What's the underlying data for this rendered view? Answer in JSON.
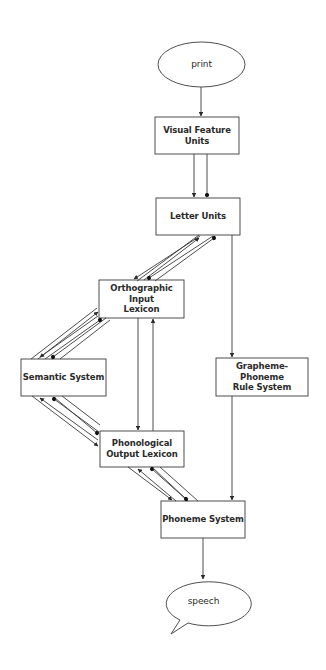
{
  "diagram": {
    "type": "dual-route reading model flow diagram",
    "colors": {
      "stroke": "#3a3a3a",
      "fill": "#ffffff",
      "text": "#2a2a2a",
      "background": "#ffffff"
    },
    "nodes": {
      "print": {
        "label": "print",
        "shape": "ellipse"
      },
      "visual_feature_units": {
        "label": "Visual Feature\nUnits",
        "shape": "box"
      },
      "letter_units": {
        "label": "Letter Units",
        "shape": "box"
      },
      "orthographic_input_lexicon": {
        "label": "Orthographic Input\nLexicon",
        "shape": "box"
      },
      "semantic_system": {
        "label": "Semantic System",
        "shape": "box"
      },
      "phonological_output_lexicon": {
        "label": "Phonological\nOutput Lexicon",
        "shape": "box"
      },
      "grapheme_phoneme_rule_system": {
        "label": "Grapheme-Phoneme\nRule System",
        "shape": "box"
      },
      "phoneme_system": {
        "label": "Phoneme System",
        "shape": "box"
      },
      "speech": {
        "label": "speech",
        "shape": "speech-bubble"
      }
    },
    "edges": [
      {
        "from": "print",
        "to": "visual_feature_units",
        "kind": "excitatory"
      },
      {
        "from": "visual_feature_units",
        "to": "letter_units",
        "kind": "excitatory + inhibitory"
      },
      {
        "from": "letter_units",
        "to": "orthographic_input_lexicon",
        "kind": "bidirectional excitatory/inhibitory bundle"
      },
      {
        "from": "letter_units",
        "to": "grapheme_phoneme_rule_system",
        "kind": "excitatory"
      },
      {
        "from": "orthographic_input_lexicon",
        "to": "semantic_system",
        "kind": "bidirectional excitatory/inhibitory bundle"
      },
      {
        "from": "orthographic_input_lexicon",
        "to": "phonological_output_lexicon",
        "kind": "excitatory (bidirectional pair)"
      },
      {
        "from": "semantic_system",
        "to": "phonological_output_lexicon",
        "kind": "bidirectional excitatory/inhibitory bundle"
      },
      {
        "from": "phonological_output_lexicon",
        "to": "phoneme_system",
        "kind": "bidirectional excitatory/inhibitory bundle"
      },
      {
        "from": "grapheme_phoneme_rule_system",
        "to": "phoneme_system",
        "kind": "excitatory"
      },
      {
        "from": "phoneme_system",
        "to": "speech",
        "kind": "excitatory"
      }
    ]
  }
}
